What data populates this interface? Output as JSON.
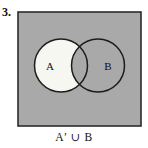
{
  "figure": {
    "exercise_number": "3.",
    "caption": "A′ ∪ B",
    "set_label_a": "A",
    "set_label_b": "B"
  },
  "colors": {
    "page_background": "#ffffff",
    "universal_set_fill": "#a9a9a9",
    "universal_set_border": "#2b2b2b",
    "circle_stroke": "#1c1c1c",
    "unshaded_region_fill": "#f7f7f2",
    "text": "#101010"
  },
  "geometry": {
    "rectangle": {
      "x": 18,
      "y": 12,
      "width": 123,
      "height": 114
    },
    "circle_a": {
      "cx": 61,
      "cy": 65.5,
      "r": 26.5
    },
    "circle_b": {
      "cx": 98,
      "cy": 65.5,
      "r": 26.5
    },
    "label_a": {
      "x": 50,
      "y": 67
    },
    "label_b": {
      "x": 108,
      "y": 67
    }
  },
  "shading": {
    "shaded_description": "A-complement union B",
    "white_region": "A minus B",
    "gray_regions": [
      "universe outside both circles",
      "A intersect B",
      "B minus A"
    ]
  }
}
